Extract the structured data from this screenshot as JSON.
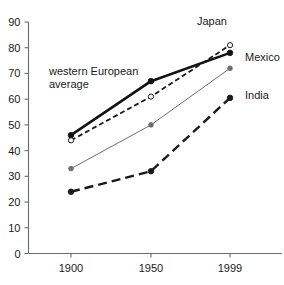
{
  "chart_data": {
    "type": "line",
    "title": "",
    "subtitle": "",
    "xlabel": "",
    "ylabel": "",
    "categories": [
      "1900",
      "1950",
      "1999"
    ],
    "x_tick_labels": [
      "1900",
      "1950",
      "1999"
    ],
    "y_tick_labels": [
      "0",
      "10",
      "20",
      "30",
      "40",
      "50",
      "60",
      "70",
      "80",
      "90"
    ],
    "y_ticks": [
      0,
      10,
      20,
      30,
      40,
      50,
      60,
      70,
      80,
      90
    ],
    "ylim": [
      0,
      90
    ],
    "grid": false,
    "legend_position": "inline-annotations",
    "series": [
      {
        "name": "western European average",
        "label": "western European average",
        "values": [
          46,
          67,
          78
        ],
        "line_style": "solid",
        "line_width": 2.6,
        "marker": "filled-circle",
        "color": "#111111"
      },
      {
        "name": "Japan",
        "label": "Japan",
        "values": [
          44,
          61,
          81
        ],
        "line_style": "short-dash",
        "line_width": 1.8,
        "marker": "open-circle",
        "color": "#1a1a1a"
      },
      {
        "name": "Mexico",
        "label": "Mexico",
        "values": [
          33,
          50,
          72
        ],
        "line_style": "solid",
        "line_width": 1.0,
        "marker": "filled-circle-small",
        "color": "#6e6e6e"
      },
      {
        "name": "India",
        "label": "India",
        "values": [
          24,
          32,
          60.5
        ],
        "line_style": "long-dash",
        "line_width": 2.4,
        "marker": "filled-circle",
        "color": "#1a1a1a"
      }
    ],
    "annotations": [
      {
        "name": "western-european-average",
        "line1": "western European",
        "line2": "average"
      }
    ]
  },
  "labels": {
    "japan": "Japan",
    "mexico": "Mexico",
    "india": "India",
    "western_european_line1": "western European",
    "western_european_line2": "average"
  }
}
